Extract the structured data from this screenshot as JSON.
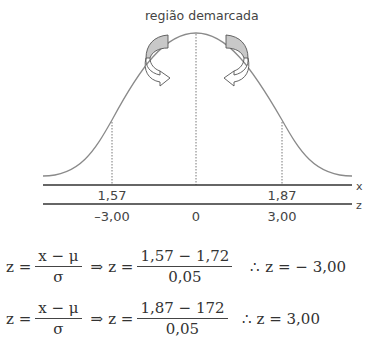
{
  "diagram": {
    "annotation": "região demarcada",
    "axis_labels": {
      "x": "x",
      "z": "z"
    },
    "x_ticks": [
      {
        "label": "1,57",
        "pos": 112
      },
      {
        "label": "1,87",
        "pos": 282
      }
    ],
    "z_ticks": [
      {
        "label": "–3,00",
        "pos": 112
      },
      {
        "label": "0",
        "pos": 196
      },
      {
        "label": "3,00",
        "pos": 282
      }
    ],
    "colors": {
      "curve": "#8a8a8a",
      "axis": "#333333",
      "arrow_fill": "#c8c8c8"
    }
  },
  "equations": [
    {
      "lhs": "z =",
      "formula_num": "x − μ",
      "formula_den": "σ",
      "implies": "⇒",
      "lhs2": "z =",
      "value_num": "1,57 − 1,72",
      "value_den": "0,05",
      "therefore": "∴",
      "result": "z =  − 3,00"
    },
    {
      "lhs": "z =",
      "formula_num": "x − μ",
      "formula_den": "σ",
      "implies": "⇒",
      "lhs2": "z =",
      "value_num": "1,87 − 172",
      "value_den": "0,05",
      "therefore": "∴",
      "result": "z = 3,00"
    }
  ]
}
